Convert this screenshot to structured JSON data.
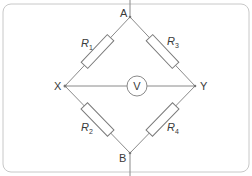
{
  "diagram": {
    "type": "wheatstone-bridge",
    "nodes": {
      "A": "A",
      "B": "B",
      "X": "X",
      "Y": "Y"
    },
    "meter_label": "V",
    "resistors": [
      {
        "name": "R",
        "sub": "1",
        "between": "A-X"
      },
      {
        "name": "R",
        "sub": "3",
        "between": "A-Y"
      },
      {
        "name": "R",
        "sub": "2",
        "between": "X-B"
      },
      {
        "name": "R",
        "sub": "4",
        "between": "Y-B"
      }
    ],
    "colors": {
      "wire": "#8a8a8a",
      "frame": "#c8c8c8",
      "text": "#3a3a3a"
    }
  }
}
